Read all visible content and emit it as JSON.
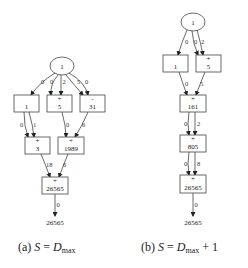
{
  "subfigures": [
    {
      "id": "a",
      "caption": {
        "prefix": "(a)",
        "var": "S",
        "eq": "=",
        "rhs_var": "D",
        "rhs_sub": "max",
        "rhs_suffix": ""
      },
      "nodes": {
        "input": {
          "value": "1"
        },
        "r1_left": {
          "op": "",
          "value": "1"
        },
        "r1_mid": {
          "op": "+",
          "value": "5"
        },
        "r1_right": {
          "op": "-",
          "value": "31"
        },
        "r2_left": {
          "op": "+",
          "value": "3"
        },
        "r2_right": {
          "op": "+",
          "value": "1989"
        },
        "r3": {
          "op": "+",
          "value": "26565"
        },
        "output": {
          "value": "26565"
        }
      },
      "edge_labels": {
        "in_to_r1_left": "0",
        "in_to_r1_mid_a": "0",
        "in_to_r1_mid_b": "2",
        "in_to_r1_right_a": "5",
        "in_to_r1_right_b": "0",
        "r1_left_to_r2_left_a": "0",
        "r1_left_to_r2_left_b": "1",
        "r1_mid_to_r2_right": "0",
        "r1_right_to_r2_right": "6",
        "r2_left_to_r3": "18",
        "r2_right_to_r3": "6",
        "r3_to_out": "0"
      }
    },
    {
      "id": "b",
      "caption": {
        "prefix": "(b)",
        "var": "S",
        "eq": "=",
        "rhs_var": "D",
        "rhs_sub": "max",
        "rhs_suffix": "+ 1"
      },
      "nodes": {
        "input": {
          "value": "1"
        },
        "r1_left": {
          "op": "",
          "value": "1"
        },
        "r1_right": {
          "op": "+",
          "value": "5"
        },
        "r2": {
          "op": "+",
          "value": "161"
        },
        "r3": {
          "op": "+",
          "value": "805"
        },
        "r4": {
          "op": "+",
          "value": "26565"
        },
        "output": {
          "value": "26565"
        }
      },
      "edge_labels": {
        "in_to_r1_left": "0",
        "in_to_r1_right_a": "0",
        "in_to_r1_right_b": "2",
        "r1_left_to_r2": "0",
        "r1_right_to_r2": "5",
        "r2_to_r3_a": "0",
        "r2_to_r3_b": "2",
        "r3_to_r4_a": "0",
        "r3_to_r4_b": "8",
        "r4_to_out": "0"
      }
    }
  ]
}
